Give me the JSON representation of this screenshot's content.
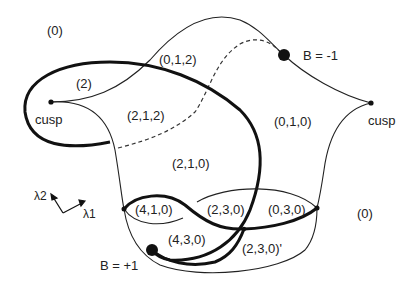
{
  "regions": {
    "outer_top_left": "(0)",
    "outer_right": "(0)",
    "r_012": "(0,1,2)",
    "r_2": "(2)",
    "r_212": "(2,1,2)",
    "r_010": "(0,1,0)",
    "r_210": "(2,1,0)",
    "r_410": "(4,1,0)",
    "r_230": "(2,3,0)",
    "r_030": "(0,3,0)",
    "r_430": "(4,3,0)",
    "r_230p": "(2,3,0)'"
  },
  "points": {
    "cusp_left": "cusp",
    "cusp_right": "cusp",
    "b_minus": "B = -1",
    "b_plus": "B = +1"
  },
  "axes": {
    "lambda1": "λ1",
    "lambda2": "λ2"
  },
  "colors": {
    "line": "#111111",
    "background": "#ffffff"
  }
}
